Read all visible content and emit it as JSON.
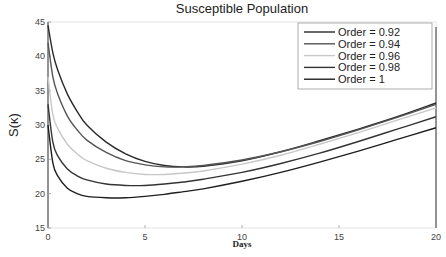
{
  "chart_data": {
    "type": "line",
    "title": "Susceptible Population",
    "xlabel": "Days",
    "ylabel": "S(κ)",
    "xlim": [
      0,
      20
    ],
    "ylim": [
      15,
      45
    ],
    "xticks": [
      0,
      5,
      10,
      15,
      20
    ],
    "yticks": [
      15,
      20,
      25,
      30,
      35,
      40,
      45
    ],
    "grid": false,
    "legend_position": "upper right",
    "x": [
      0,
      0.25,
      0.5,
      1,
      1.5,
      2,
      3,
      4,
      5,
      6,
      7,
      8,
      10,
      12,
      14,
      16,
      18,
      20
    ],
    "series": [
      {
        "name": "Order = 0.92",
        "color": "#2a2a2a",
        "values": [
          44.5,
          40.5,
          38.0,
          34.5,
          32.0,
          30.0,
          27.5,
          25.8,
          24.7,
          24.1,
          23.9,
          24.0,
          24.8,
          26.1,
          27.7,
          29.4,
          31.2,
          33.2
        ]
      },
      {
        "name": "Order = 0.94",
        "color": "#555555",
        "values": [
          42.0,
          37.0,
          34.5,
          31.3,
          29.3,
          27.8,
          26.0,
          24.8,
          24.2,
          23.9,
          23.9,
          24.1,
          24.9,
          26.1,
          27.6,
          29.3,
          31.1,
          33.0
        ]
      },
      {
        "name": "Order = 0.96",
        "color": "#c8c8c8",
        "values": [
          37.0,
          31.5,
          29.5,
          27.2,
          25.8,
          24.8,
          23.7,
          23.1,
          22.8,
          22.8,
          23.0,
          23.3,
          24.3,
          25.6,
          27.2,
          28.9,
          30.7,
          32.5
        ]
      },
      {
        "name": "Order = 0.98",
        "color": "#333333",
        "values": [
          33.0,
          27.5,
          25.5,
          23.6,
          22.6,
          22.0,
          21.4,
          21.2,
          21.2,
          21.4,
          21.7,
          22.1,
          23.1,
          24.4,
          25.9,
          27.6,
          29.4,
          31.2
        ]
      },
      {
        "name": "Order = 1",
        "color": "#1e1e1e",
        "values": [
          30.0,
          24.5,
          22.6,
          20.8,
          20.0,
          19.6,
          19.4,
          19.4,
          19.6,
          19.9,
          20.3,
          20.7,
          21.8,
          23.1,
          24.6,
          26.2,
          27.9,
          29.6
        ]
      }
    ]
  }
}
